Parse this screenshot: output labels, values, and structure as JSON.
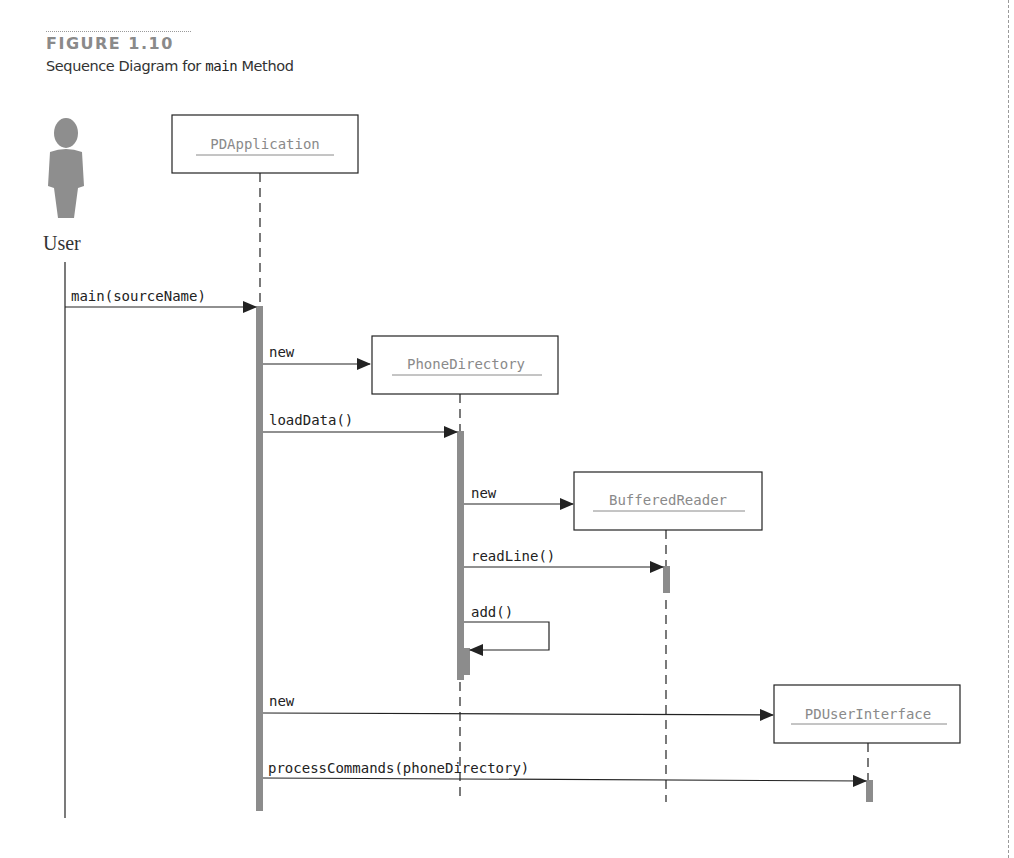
{
  "figure": {
    "number": "FIGURE 1.10",
    "caption_prefix": "Sequence Diagram for ",
    "caption_code": "main",
    "caption_suffix": " Method"
  },
  "colors": {
    "activation": "#8c8c8c",
    "object_text": "#8a8a8a",
    "line": "#222222",
    "figure_number": "#8a8a8a"
  },
  "actor": {
    "label": "User",
    "icon": "person-icon"
  },
  "objects": [
    {
      "name": "PDApplication"
    },
    {
      "name": "PhoneDirectory"
    },
    {
      "name": "BufferedReader"
    },
    {
      "name": "PDUserInterface"
    }
  ],
  "messages": [
    {
      "label": "main(sourceName)",
      "from": "User",
      "to": "PDApplication"
    },
    {
      "label": "new",
      "from": "PDApplication",
      "to": "PhoneDirectory"
    },
    {
      "label": "loadData()",
      "from": "PDApplication",
      "to": "PhoneDirectory"
    },
    {
      "label": "new",
      "from": "PhoneDirectory",
      "to": "BufferedReader"
    },
    {
      "label": "readLine()",
      "from": "PhoneDirectory",
      "to": "BufferedReader"
    },
    {
      "label": "add()",
      "from": "PhoneDirectory",
      "to": "PhoneDirectory"
    },
    {
      "label": "new",
      "from": "PDApplication",
      "to": "PDUserInterface"
    },
    {
      "label": "processCommands(phoneDirectory)",
      "from": "PDApplication",
      "to": "PDUserInterface"
    }
  ]
}
